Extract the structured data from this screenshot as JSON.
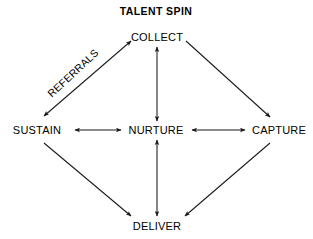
{
  "diagram": {
    "title": "TALENT SPIN",
    "type": "cycle-network-diagram",
    "background_color": "#ffffff",
    "line_color": "#1a1a1a",
    "text_color": "#000000",
    "nodes": [
      {
        "id": "collect",
        "label": "COLLECT",
        "x": 157,
        "y": 37
      },
      {
        "id": "sustain",
        "label": "SUSTAIN",
        "x": 37,
        "y": 130
      },
      {
        "id": "nurture",
        "label": "NURTURE",
        "x": 156,
        "y": 130
      },
      {
        "id": "capture",
        "label": "CAPTURE",
        "x": 279,
        "y": 130
      },
      {
        "id": "deliver",
        "label": "DELIVER",
        "x": 157,
        "y": 226
      }
    ],
    "edges": [
      {
        "id": "sustain-collect",
        "from": "sustain",
        "to": "collect",
        "arrows": "double",
        "label": "REFERRALS"
      },
      {
        "id": "collect-capture",
        "from": "collect",
        "to": "capture",
        "arrows": "single",
        "label": ""
      },
      {
        "id": "sustain-deliver",
        "from": "sustain",
        "to": "deliver",
        "arrows": "single",
        "label": ""
      },
      {
        "id": "capture-deliver",
        "from": "capture",
        "to": "deliver",
        "arrows": "single",
        "label": ""
      },
      {
        "id": "collect-nurture",
        "from": "collect",
        "to": "nurture",
        "arrows": "double",
        "label": ""
      },
      {
        "id": "nurture-deliver",
        "from": "nurture",
        "to": "deliver",
        "arrows": "double",
        "label": ""
      },
      {
        "id": "sustain-nurture",
        "from": "sustain",
        "to": "nurture",
        "arrows": "double",
        "label": ""
      },
      {
        "id": "nurture-capture",
        "from": "nurture",
        "to": "capture",
        "arrows": "double",
        "label": ""
      }
    ],
    "edge_labels": [
      {
        "id": "referrals",
        "text": "REFERRALS"
      }
    ]
  }
}
